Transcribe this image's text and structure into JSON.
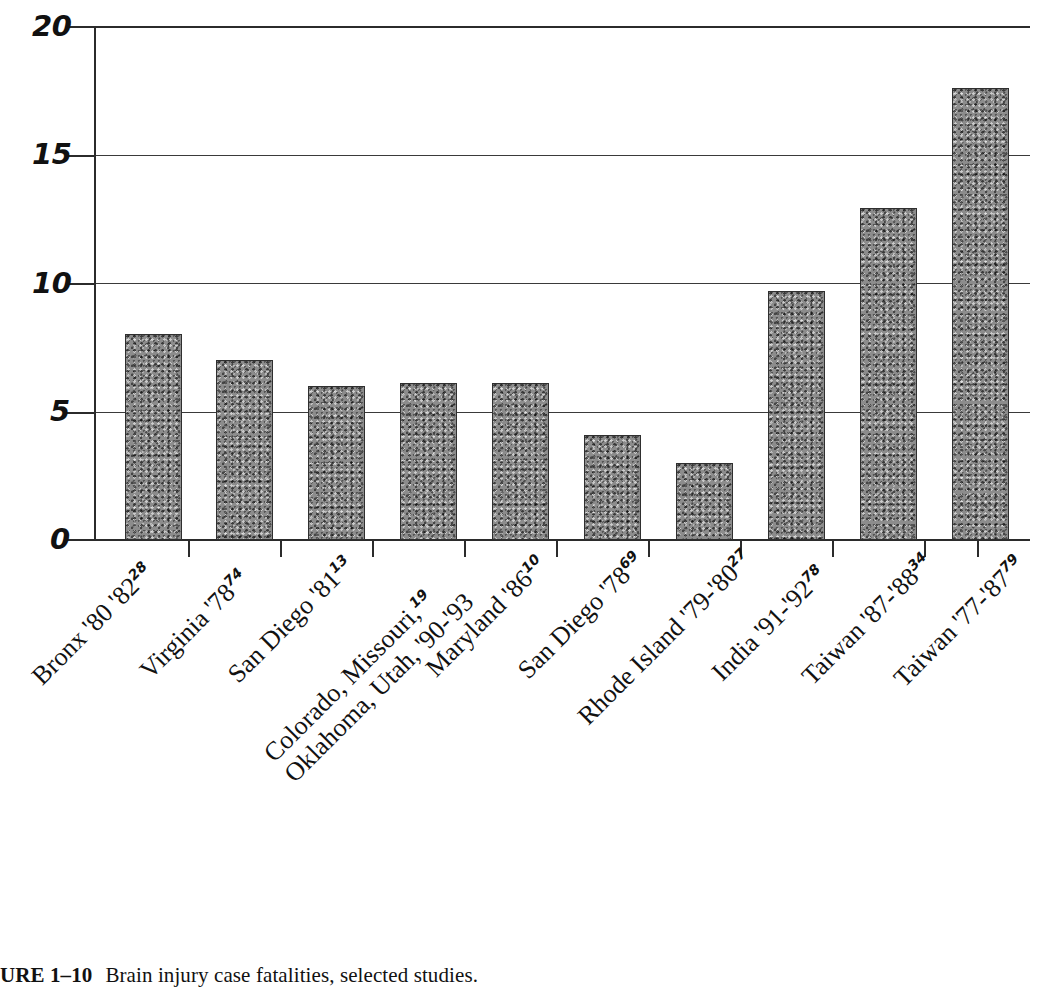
{
  "figure": {
    "caption_number": "URE 1–10",
    "caption_text": "Brain injury case fatalities, selected studies."
  },
  "chart_data": {
    "type": "bar",
    "title": "",
    "xlabel": "",
    "ylabel": "",
    "ylim": [
      0,
      20
    ],
    "yticks": [
      0,
      5,
      10,
      15,
      20
    ],
    "grid": true,
    "legend": "none",
    "categories": [
      "Bronx '80 '82",
      "Virginia '78",
      "San Diego '81",
      "Colorado, Missouri, Oklahoma, Utah, '90-'93",
      "Maryland '86",
      "San Diego '78",
      "Rhode Island '79-'80",
      "India '91-'92",
      "Taiwan '87-'88",
      "Taiwan '77-'87"
    ],
    "references": [
      "28",
      "74",
      "13",
      "19",
      "10",
      "69",
      "27",
      "78",
      "34",
      "79"
    ],
    "values": [
      8.0,
      7.0,
      6.0,
      6.1,
      6.1,
      4.1,
      3.0,
      9.7,
      12.9,
      17.6
    ]
  },
  "axis": {
    "y_tick_labels": [
      "20",
      "15",
      "10",
      "5",
      "0"
    ]
  },
  "category_label_lines": [
    {
      "line1": "Bronx '80 '82",
      "sup": "28",
      "line2": ""
    },
    {
      "line1": "Virginia '78",
      "sup": "74",
      "line2": ""
    },
    {
      "line1": "San Diego '81",
      "sup": "13",
      "line2": ""
    },
    {
      "line1": "Colorado, Missouri,",
      "sup": "19",
      "line2": "Oklahoma, Utah, '90-'93"
    },
    {
      "line1": "Maryland '86",
      "sup": "10",
      "line2": ""
    },
    {
      "line1": "San Diego '78",
      "sup": "69",
      "line2": ""
    },
    {
      "line1": "Rhode Island '79-'80",
      "sup": "27",
      "line2": ""
    },
    {
      "line1": "India '91-'92",
      "sup": "78",
      "line2": ""
    },
    {
      "line1": "Taiwan '87-'88",
      "sup": "34",
      "line2": ""
    },
    {
      "line1": "Taiwan '77-'87",
      "sup": "79",
      "line2": ""
    }
  ],
  "colors": {
    "bar_fill": "#8c8c8c",
    "bar_stroke": "#2f2f2f",
    "axis": "#2b2b2b",
    "grid": "#3a3a3a",
    "text": "#111111",
    "background": "#ffffff"
  }
}
